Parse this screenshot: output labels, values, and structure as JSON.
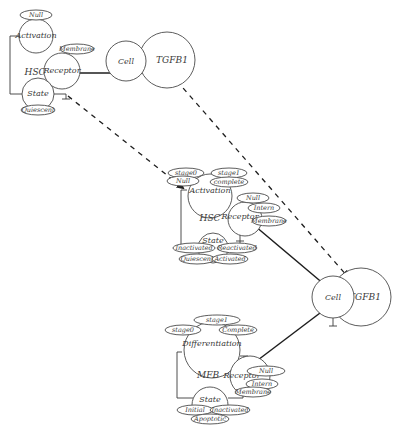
{
  "diagram": {
    "colors": {
      "line": "#3a3a3a",
      "background": "#ffffff"
    },
    "top_group": {
      "compartment_label": "HSC",
      "activation": {
        "label": "Activation",
        "state": "Null"
      },
      "receptor": {
        "label": "Receptor",
        "state": "Membrane"
      },
      "state_node": {
        "label": "State",
        "state": "Quiescent"
      },
      "cell": "Cell",
      "ligand": "TGFB1"
    },
    "middle_group": {
      "compartment_label": "HSC",
      "activation": {
        "label": "Activation",
        "states": [
          "stage0",
          "stage1",
          "Null",
          "complete"
        ]
      },
      "receptor": {
        "label": "Receptor",
        "states": [
          "Null",
          "Intern",
          "Membrane"
        ]
      },
      "state_node": {
        "label": "State",
        "states": [
          "Inactivated",
          "Reactivated",
          "Quiescent",
          "Activated"
        ]
      }
    },
    "right_group": {
      "cell": "Cell",
      "ligand": "TGFB1"
    },
    "bottom_group": {
      "compartment_label": "MFB",
      "differentiation": {
        "label": "Differentiation",
        "states": [
          "stage1",
          "stage0",
          "Complete"
        ]
      },
      "receptor": {
        "label": "Receptor",
        "states": [
          "Null",
          "Intern",
          "Membrane"
        ]
      },
      "state_node": {
        "label": "State",
        "states": [
          "Initial",
          "Inactivated",
          "Apoptotic"
        ]
      }
    }
  }
}
